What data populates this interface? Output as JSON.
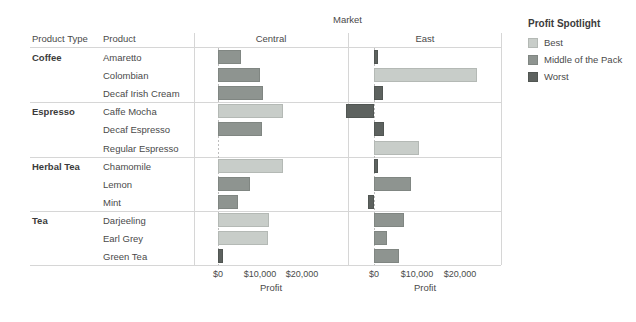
{
  "header": {
    "market_title": "Market",
    "col_product_type": "Product Type",
    "col_product": "Product",
    "col_central": "Central",
    "col_east": "East"
  },
  "legend": {
    "title": "Profit Spotlight",
    "items": [
      {
        "label": "Best",
        "color": "#c8cdc9",
        "key": "best"
      },
      {
        "label": "Middle of the Pack",
        "color": "#8e9490",
        "key": "mid"
      },
      {
        "label": "Worst",
        "color": "#5d625f",
        "key": "worst"
      }
    ]
  },
  "axis": {
    "label": "Profit",
    "ticks": [
      "$0",
      "$10,000",
      "$20,000"
    ],
    "tick_values": [
      0,
      10000,
      20000
    ]
  },
  "groups": [
    {
      "type": "Coffee",
      "products": [
        "Amaretto",
        "Colombian",
        "Decaf Irish Cream"
      ]
    },
    {
      "type": "Espresso",
      "products": [
        "Caffe Mocha",
        "Decaf Espresso",
        "Regular Espresso"
      ]
    },
    {
      "type": "Herbal Tea",
      "products": [
        "Chamomile",
        "Lemon",
        "Mint"
      ]
    },
    {
      "type": "Tea",
      "products": [
        "Darjeeling",
        "Earl Grey",
        "Green Tea"
      ]
    }
  ],
  "chart_data": {
    "type": "bar",
    "title": "Market",
    "xlabel": "Profit",
    "ylabel": "",
    "xlim": [
      -8000,
      26000
    ],
    "grid": false,
    "orientation": "horizontal",
    "panels": [
      "Central",
      "East"
    ],
    "rows": [
      {
        "product_type": "Coffee",
        "product": "Amaretto",
        "central": {
          "value": 5500,
          "spotlight": "Middle of the Pack"
        },
        "east": {
          "value": 900,
          "spotlight": "Worst"
        }
      },
      {
        "product_type": "Coffee",
        "product": "Colombian",
        "central": {
          "value": 10000,
          "spotlight": "Middle of the Pack"
        },
        "east": {
          "value": 24000,
          "spotlight": "Best"
        }
      },
      {
        "product_type": "Coffee",
        "product": "Decaf Irish Cream",
        "central": {
          "value": 10700,
          "spotlight": "Middle of the Pack"
        },
        "east": {
          "value": 2100,
          "spotlight": "Worst"
        }
      },
      {
        "product_type": "Espresso",
        "product": "Caffe Mocha",
        "central": {
          "value": 15500,
          "spotlight": "Best"
        },
        "east": {
          "value": -6400,
          "spotlight": "Worst"
        }
      },
      {
        "product_type": "Espresso",
        "product": "Decaf Espresso",
        "central": {
          "value": 10500,
          "spotlight": "Middle of the Pack"
        },
        "east": {
          "value": 2400,
          "spotlight": "Worst"
        }
      },
      {
        "product_type": "Espresso",
        "product": "Regular Espresso",
        "central": {
          "value": 0,
          "spotlight": "Middle of the Pack"
        },
        "east": {
          "value": 10500,
          "spotlight": "Best"
        }
      },
      {
        "product_type": "Herbal Tea",
        "product": "Chamomile",
        "central": {
          "value": 15500,
          "spotlight": "Best"
        },
        "east": {
          "value": 900,
          "spotlight": "Worst"
        }
      },
      {
        "product_type": "Herbal Tea",
        "product": "Lemon",
        "central": {
          "value": 7600,
          "spotlight": "Middle of the Pack"
        },
        "east": {
          "value": 8600,
          "spotlight": "Middle of the Pack"
        }
      },
      {
        "product_type": "Herbal Tea",
        "product": "Mint",
        "central": {
          "value": 4800,
          "spotlight": "Middle of the Pack"
        },
        "east": {
          "value": -1400,
          "spotlight": "Worst"
        }
      },
      {
        "product_type": "Tea",
        "product": "Darjeeling",
        "central": {
          "value": 12100,
          "spotlight": "Best"
        },
        "east": {
          "value": 6900,
          "spotlight": "Middle of the Pack"
        }
      },
      {
        "product_type": "Tea",
        "product": "Earl Grey",
        "central": {
          "value": 11900,
          "spotlight": "Best"
        },
        "east": {
          "value": 3100,
          "spotlight": "Middle of the Pack"
        }
      },
      {
        "product_type": "Tea",
        "product": "Green Tea",
        "central": {
          "value": 1200,
          "spotlight": "Worst"
        },
        "east": {
          "value": 5700,
          "spotlight": "Middle of the Pack"
        }
      }
    ]
  }
}
